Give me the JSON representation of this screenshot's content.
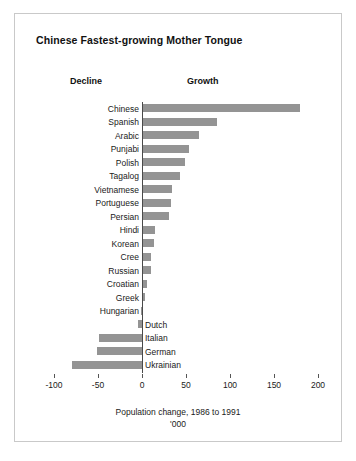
{
  "figure": {
    "title": "Chinese Fastest-growing Mother Tongue",
    "decline_heading": "Decline",
    "growth_heading": "Growth"
  },
  "chart_data": {
    "type": "bar",
    "orientation": "horizontal",
    "title": "Chinese Fastest-growing Mother Tongue",
    "xlabel": "Population change, 1986 to 1991",
    "units": "'000",
    "ylabel": "",
    "xlim": [
      -100,
      200
    ],
    "xticks": [
      -100,
      -50,
      0,
      50,
      100,
      150,
      200
    ],
    "xtick_labels": [
      "-100",
      "-50",
      "0",
      "50",
      "100",
      "150",
      "200"
    ],
    "grid": false,
    "legend": null,
    "bar_color": "#949494",
    "axis_color": "#4a4a4a",
    "categories": [
      "Chinese",
      "Spanish",
      "Arabic",
      "Punjabi",
      "Polish",
      "Tagalog",
      "Vietnamese",
      "Portuguese",
      "Persian",
      "Hindi",
      "Korean",
      "Cree",
      "Russian",
      "Croatian",
      "Greek",
      "Hungarian",
      "Dutch",
      "Italian",
      "German",
      "Ukrainian"
    ],
    "values": [
      178,
      84,
      64,
      52,
      48,
      42,
      33,
      32,
      29,
      14,
      12,
      9,
      9,
      5,
      2,
      -1,
      -5,
      -49,
      -51,
      -79
    ],
    "label_side": [
      "left",
      "left",
      "left",
      "left",
      "left",
      "left",
      "left",
      "left",
      "left",
      "left",
      "left",
      "left",
      "left",
      "left",
      "left",
      "left",
      "right",
      "right",
      "right",
      "right"
    ]
  }
}
